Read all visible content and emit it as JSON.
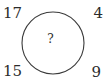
{
  "figure": {
    "type": "circle-with-corner-numbers",
    "background_color": "#ffffff",
    "stroke_color": "#3a3a3a",
    "text_color": "#2b2b2b"
  },
  "circle": {
    "center_x": 53,
    "center_y": 43,
    "radius": 31,
    "stroke_width": 1
  },
  "corners": {
    "top_left": "17",
    "top_right": "4",
    "bottom_left": "15",
    "bottom_right": "9"
  },
  "center": {
    "label": "?"
  }
}
